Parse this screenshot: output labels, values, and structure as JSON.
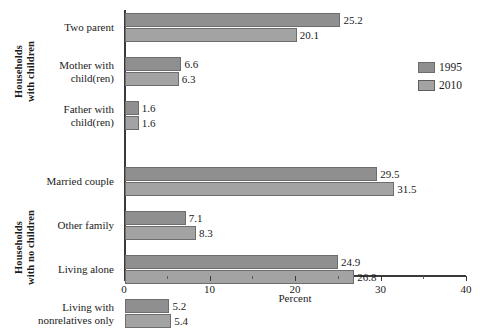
{
  "chart_data": {
    "type": "bar",
    "orientation": "horizontal",
    "title": "",
    "xlabel": "Percent",
    "ylabel": "",
    "xlim": [
      0,
      40
    ],
    "xticks": [
      0,
      10,
      20,
      30,
      40
    ],
    "xtick_labels": [
      "0",
      "10",
      "20",
      "30",
      "40"
    ],
    "minor_tick_interval": 5,
    "grid": false,
    "legend_position": "right",
    "categories": [
      "Two parent",
      "Mother with child(ren)",
      "Father with child(ren)",
      "Married couple",
      "Other family",
      "Living alone",
      "Living with nonrelatives only"
    ],
    "series": [
      {
        "name": "1995",
        "color": "#8f8f8f",
        "values": [
          25.2,
          6.6,
          1.6,
          29.5,
          7.1,
          24.9,
          5.2
        ]
      },
      {
        "name": "2010",
        "color": "#a3a3a3",
        "values": [
          20.1,
          6.3,
          1.6,
          31.5,
          8.3,
          26.8,
          5.4
        ]
      }
    ],
    "groups": [
      {
        "label": "Households with children",
        "label_line_1": "Households",
        "label_line_2": "with children",
        "category_indices": [
          0,
          1,
          2
        ]
      },
      {
        "label": "Households with no children",
        "label_line_1": "Households",
        "label_line_2": "with no children",
        "category_indices": [
          3,
          4,
          5,
          6
        ]
      }
    ],
    "value_labels": {
      "0": {
        "1995": "25.2",
        "2010": "20.1"
      },
      "1": {
        "1995": "6.6",
        "2010": "6.3"
      },
      "2": {
        "1995": "1.6",
        "2010": "1.6"
      },
      "3": {
        "1995": "29.5",
        "2010": "31.5"
      },
      "4": {
        "1995": "7.1",
        "2010": "8.3"
      },
      "5": {
        "1995": "24.9",
        "2010": "26.8"
      },
      "6": {
        "1995": "5.2",
        "2010": "5.4"
      }
    }
  },
  "category_labels": [
    {
      "line_1": "Two parent",
      "line_2": ""
    },
    {
      "line_1": "Mother with",
      "line_2": "child(ren)"
    },
    {
      "line_1": "Father with",
      "line_2": "child(ren)"
    },
    {
      "line_1": "Married couple",
      "line_2": ""
    },
    {
      "line_1": "Other family",
      "line_2": ""
    },
    {
      "line_1": "Living alone",
      "line_2": ""
    },
    {
      "line_1": "Living with",
      "line_2": "nonrelatives only"
    }
  ],
  "legend": {
    "items": [
      {
        "label": "1995",
        "color": "#8f8f8f"
      },
      {
        "label": "2010",
        "color": "#a3a3a3"
      }
    ]
  },
  "axis": {
    "x_title": "Percent"
  }
}
